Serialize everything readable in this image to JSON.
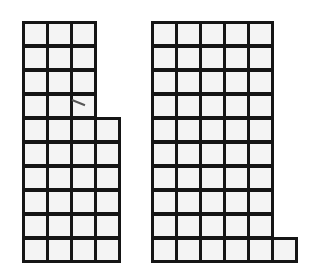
{
  "figure": {
    "line_color": "#151515",
    "fill_color": "#f4f4f4",
    "cell_size_px": 24
  },
  "shapes": [
    {
      "name": "left-shape",
      "origin": [
        22,
        21
      ],
      "rows": [
        3,
        3,
        3,
        3,
        4,
        4,
        4,
        4,
        4,
        4
      ],
      "total_squares": 36
    },
    {
      "name": "right-shape",
      "origin": [
        151,
        21
      ],
      "rows": [
        5,
        5,
        5,
        5,
        5,
        5,
        5,
        5,
        5,
        6
      ],
      "total_squares": 51
    }
  ]
}
